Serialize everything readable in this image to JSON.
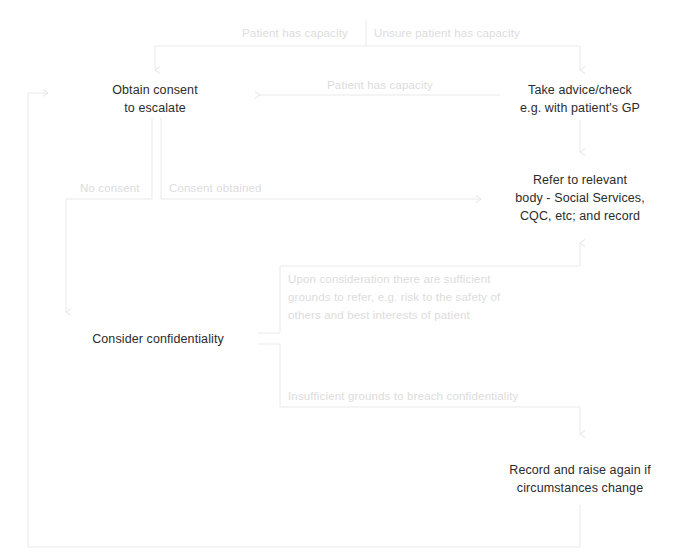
{
  "diagram": {
    "colors": {
      "node_text": "#2b2b2b",
      "edge_label_text": "#dcdcdd",
      "connector_line": "#e8e8e9",
      "background": "#ffffff"
    },
    "nodes": [
      {
        "id": "obtain-consent",
        "label": "Obtain consent\nto escalate"
      },
      {
        "id": "take-advice",
        "label": "Take advice/check\ne.g. with patient's GP"
      },
      {
        "id": "refer-to-body",
        "label": "Refer to relevant\nbody - Social Services,\nCQC, etc; and record"
      },
      {
        "id": "consider-confidentiality",
        "label": "Consider confidentiality"
      },
      {
        "id": "record-and-raise",
        "label": "Record and raise again if\ncircumstances change"
      }
    ],
    "edge_labels": [
      {
        "id": "patient-has-capacity-top",
        "label": "Patient has capacity"
      },
      {
        "id": "unsure-patient-has-capacity",
        "label": "Unsure patient has capacity"
      },
      {
        "id": "patient-has-capacity-return",
        "label": "Patient has capacity"
      },
      {
        "id": "no-consent",
        "label": "No consent"
      },
      {
        "id": "consent-obtained",
        "label": "Consent obtained"
      },
      {
        "id": "sufficient-grounds",
        "label": "Upon consideration there are sufficient\ngrounds to refer, e.g. risk to the safety of\nothers and best interests of patient"
      },
      {
        "id": "insufficient-grounds",
        "label": "Insufficient grounds to breach confidentiality"
      }
    ]
  }
}
